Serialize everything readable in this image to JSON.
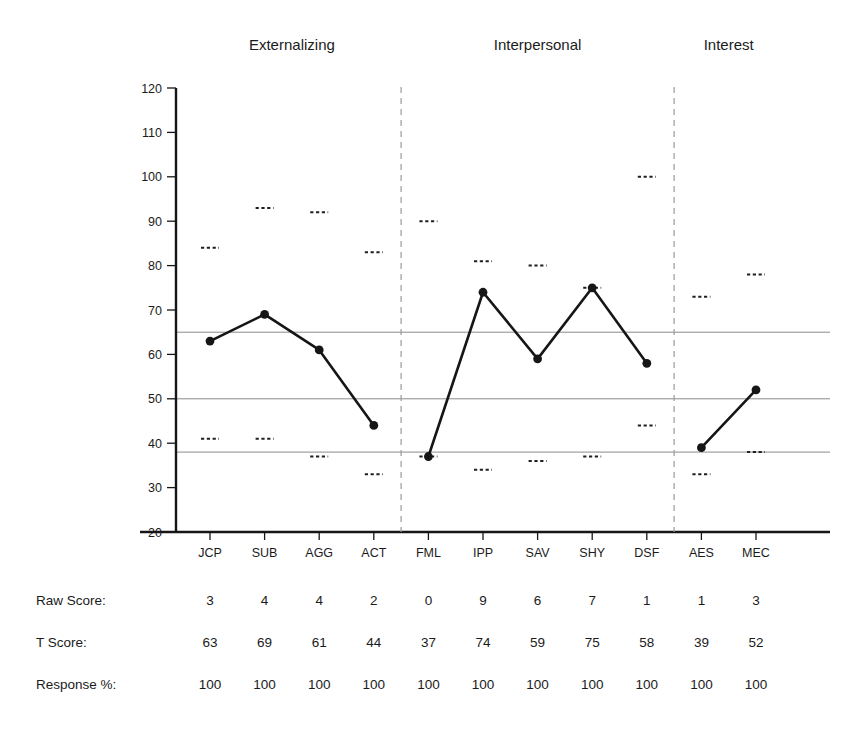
{
  "chart_data": {
    "type": "line",
    "title": "",
    "xlabel": "",
    "ylabel": "",
    "ylim": [
      20,
      120
    ],
    "yticks": [
      20,
      30,
      40,
      50,
      60,
      70,
      80,
      90,
      100,
      110,
      120
    ],
    "grid": false,
    "reference_lines": [
      65,
      50,
      38
    ],
    "group_separators_after": [
      "ACT",
      "DSF"
    ],
    "groups": [
      {
        "name": "Externalizing",
        "scales": [
          "JCP",
          "SUB",
          "AGG",
          "ACT"
        ]
      },
      {
        "name": "Interpersonal",
        "scales": [
          "FML",
          "IPP",
          "SAV",
          "SHY",
          "DSF"
        ]
      },
      {
        "name": "Interest",
        "scales": [
          "AES",
          "MEC"
        ]
      }
    ],
    "categories": [
      "JCP",
      "SUB",
      "AGG",
      "ACT",
      "FML",
      "IPP",
      "SAV",
      "SHY",
      "DSF",
      "AES",
      "MEC"
    ],
    "series": [
      {
        "name": "T Score",
        "values": [
          63,
          69,
          61,
          44,
          37,
          74,
          59,
          75,
          58,
          39,
          52
        ]
      }
    ],
    "confidence_upper": [
      84,
      93,
      92,
      83,
      90,
      81,
      80,
      75,
      100,
      73,
      78
    ],
    "confidence_lower": [
      41,
      41,
      37,
      33,
      37,
      34,
      36,
      37,
      44,
      33,
      38
    ],
    "marker_style": "filled-circle",
    "confidence_marker_style": "dashed-tick",
    "line_color": "#161616",
    "reference_line_color": "#8a8a8a",
    "separator_color": "#9a9a9a"
  },
  "table": {
    "rows": [
      {
        "label": "Raw Score:",
        "values": [
          "3",
          "4",
          "4",
          "2",
          "0",
          "9",
          "6",
          "7",
          "1",
          "1",
          "3"
        ]
      },
      {
        "label": "T Score:",
        "values": [
          "63",
          "69",
          "61",
          "44",
          "37",
          "74",
          "59",
          "75",
          "58",
          "39",
          "52"
        ]
      },
      {
        "label": "Response %:",
        "values": [
          "100",
          "100",
          "100",
          "100",
          "100",
          "100",
          "100",
          "100",
          "100",
          "100",
          "100"
        ]
      }
    ]
  }
}
